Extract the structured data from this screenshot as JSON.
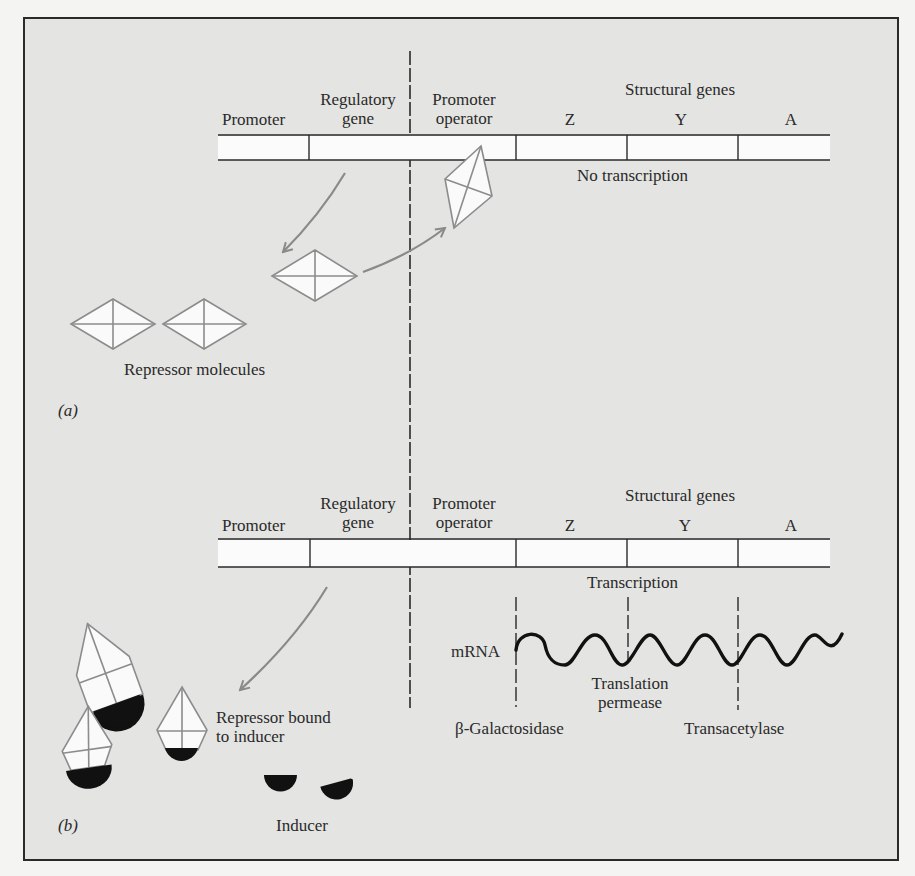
{
  "panel_a": {
    "label": "(a)",
    "headers": {
      "promoter": "Promoter",
      "regulatory_gene_line1": "Regulatory",
      "regulatory_gene_line2": "gene",
      "promoter_operator_line1": "Promoter",
      "promoter_operator_line2": "operator",
      "structural_genes": "Structural genes",
      "gene_z": "Z",
      "gene_y": "Y",
      "gene_a": "A"
    },
    "status": "No transcription",
    "repressor_label": "Repressor molecules"
  },
  "panel_b": {
    "label": "(b)",
    "headers": {
      "promoter": "Promoter",
      "regulatory_gene_line1": "Regulatory",
      "regulatory_gene_line2": "gene",
      "promoter_operator_line1": "Promoter",
      "promoter_operator_line2": "operator",
      "structural_genes": "Structural genes",
      "gene_z": "Z",
      "gene_y": "Y",
      "gene_a": "A"
    },
    "status": "Transcription",
    "mrna_label": "mRNA",
    "translation_line1": "Translation",
    "translation_line2": "permease",
    "beta_galactosidase": "β-Galactosidase",
    "transacetylase": "Transacetylase",
    "bound_label_line1": "Repressor bound",
    "bound_label_line2": "to inducer",
    "inducer_label": "Inducer"
  },
  "colors": {
    "background": "#e4e4e2",
    "line": "#2a2a2a",
    "arrow": "#8a8a8a",
    "shape_outline": "#8c8c8c",
    "shape_fill": "#fafafa",
    "inducer": "#111111"
  }
}
